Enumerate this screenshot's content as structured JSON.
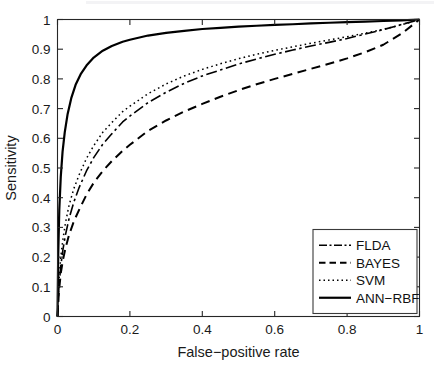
{
  "chart_data": {
    "type": "line",
    "title": "",
    "xlabel": "False−positive rate",
    "ylabel": "Sensitivity",
    "xlim": [
      0,
      1
    ],
    "ylim": [
      0,
      1
    ],
    "xticks": [
      0,
      0.2,
      0.4,
      0.6,
      0.8,
      1
    ],
    "xticklabels": [
      "0",
      "0.2",
      "0.4",
      "0.6",
      "0.8",
      "1"
    ],
    "yticks": [
      0,
      0.1,
      0.2,
      0.3,
      0.4,
      0.5,
      0.6,
      0.7,
      0.8,
      0.9,
      1
    ],
    "yticklabels": [
      "0",
      "0.1",
      "0.2",
      "0.3",
      "0.4",
      "0.5",
      "0.6",
      "0.7",
      "0.8",
      "0.9",
      "1"
    ],
    "grid": false,
    "box": true,
    "tick_direction": "in",
    "legend_position": "lower right",
    "series": [
      {
        "name": "FLDA",
        "style": "dash-dot",
        "color": "#000000",
        "width": 1.6,
        "dasharray": "11,3.5,2.5,3.5",
        "x": [
          0,
          0.004,
          0.009,
          0.015,
          0.022,
          0.032,
          0.045,
          0.06,
          0.08,
          0.1,
          0.125,
          0.15,
          0.18,
          0.2,
          0.25,
          0.3,
          0.35,
          0.4,
          0.45,
          0.5,
          0.55,
          0.6,
          0.65,
          0.7,
          0.75,
          0.8,
          0.85,
          0.9,
          0.95,
          1
        ],
        "y": [
          0,
          0.1,
          0.17,
          0.225,
          0.275,
          0.33,
          0.385,
          0.435,
          0.49,
          0.535,
          0.58,
          0.615,
          0.655,
          0.675,
          0.72,
          0.755,
          0.785,
          0.81,
          0.83,
          0.85,
          0.867,
          0.883,
          0.897,
          0.911,
          0.923,
          0.936,
          0.951,
          0.966,
          0.983,
          1
        ]
      },
      {
        "name": "BAYES",
        "style": "dashed",
        "color": "#000000",
        "width": 2.0,
        "dasharray": "9,5.5",
        "x": [
          0,
          0.004,
          0.009,
          0.015,
          0.022,
          0.032,
          0.045,
          0.06,
          0.08,
          0.1,
          0.125,
          0.15,
          0.18,
          0.2,
          0.25,
          0.3,
          0.35,
          0.4,
          0.45,
          0.5,
          0.55,
          0.6,
          0.65,
          0.7,
          0.75,
          0.8,
          0.85,
          0.9,
          0.95,
          1
        ],
        "y": [
          0,
          0.085,
          0.145,
          0.19,
          0.23,
          0.275,
          0.32,
          0.36,
          0.41,
          0.45,
          0.49,
          0.523,
          0.558,
          0.578,
          0.625,
          0.66,
          0.69,
          0.716,
          0.74,
          0.762,
          0.782,
          0.8,
          0.817,
          0.834,
          0.851,
          0.869,
          0.89,
          0.915,
          0.952,
          1
        ]
      },
      {
        "name": "SVM",
        "style": "dotted",
        "color": "#000000",
        "width": 1.5,
        "dasharray": "1.6,3.2",
        "x": [
          0,
          0.004,
          0.009,
          0.015,
          0.022,
          0.032,
          0.045,
          0.06,
          0.08,
          0.1,
          0.125,
          0.15,
          0.18,
          0.2,
          0.25,
          0.3,
          0.35,
          0.4,
          0.45,
          0.5,
          0.55,
          0.6,
          0.65,
          0.7,
          0.75,
          0.8,
          0.85,
          0.9,
          0.95,
          1
        ],
        "y": [
          0,
          0.12,
          0.2,
          0.26,
          0.315,
          0.375,
          0.43,
          0.478,
          0.532,
          0.575,
          0.62,
          0.653,
          0.69,
          0.708,
          0.75,
          0.783,
          0.81,
          0.832,
          0.851,
          0.868,
          0.883,
          0.896,
          0.908,
          0.92,
          0.931,
          0.942,
          0.954,
          0.967,
          0.982,
          1
        ]
      },
      {
        "name": "ANN−RBF",
        "style": "solid",
        "color": "#000000",
        "width": 2.2,
        "dasharray": "none",
        "x": [
          0,
          0.002,
          0.005,
          0.009,
          0.014,
          0.02,
          0.028,
          0.038,
          0.05,
          0.065,
          0.08,
          0.1,
          0.125,
          0.15,
          0.18,
          0.2,
          0.25,
          0.3,
          0.35,
          0.4,
          0.45,
          0.5,
          0.55,
          0.6,
          0.65,
          0.7,
          0.75,
          0.8,
          0.85,
          0.9,
          0.95,
          1
        ],
        "y": [
          0,
          0.21,
          0.36,
          0.47,
          0.555,
          0.62,
          0.682,
          0.735,
          0.78,
          0.818,
          0.845,
          0.872,
          0.895,
          0.911,
          0.925,
          0.932,
          0.946,
          0.955,
          0.962,
          0.968,
          0.972,
          0.976,
          0.979,
          0.982,
          0.984,
          0.987,
          0.989,
          0.991,
          0.993,
          0.995,
          0.997,
          1
        ]
      }
    ],
    "legend": [
      {
        "label": "FLDA",
        "style": "dash-dot",
        "dasharray": "8,2.5,2,2.5",
        "width": 1.6
      },
      {
        "label": "BAYES",
        "style": "dashed",
        "dasharray": "6.5,4",
        "width": 2.0
      },
      {
        "label": "SVM",
        "style": "dotted",
        "dasharray": "1.5,3",
        "width": 1.5
      },
      {
        "label": "ANN−RBF",
        "style": "solid",
        "dasharray": "none",
        "width": 2.2
      }
    ]
  },
  "figure": {
    "background": "#ffffff",
    "axis_color": "#262626"
  }
}
